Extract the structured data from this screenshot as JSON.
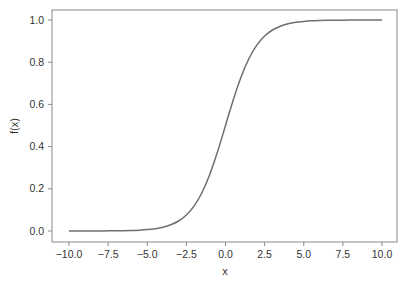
{
  "chart_data": {
    "type": "line",
    "title": "",
    "xlabel": "x",
    "ylabel": "f(x)",
    "xlim": [
      -10.8,
      11.0
    ],
    "ylim": [
      -0.05,
      1.05
    ],
    "grid": false,
    "legend": null,
    "x_ticks": [
      -10.0,
      -7.5,
      -5.0,
      -2.5,
      0.0,
      2.5,
      5.0,
      7.5,
      10.0
    ],
    "x_tick_labels": [
      "−10.0",
      "−7.5",
      "−5.0",
      "−2.5",
      "0.0",
      "2.5",
      "5.0",
      "7.5",
      "10.0"
    ],
    "y_ticks": [
      0.0,
      0.2,
      0.4,
      0.6,
      0.8,
      1.0
    ],
    "y_tick_labels": [
      "0.0",
      "0.2",
      "0.4",
      "0.6",
      "0.8",
      "1.0"
    ],
    "series": [
      {
        "name": "f(x)",
        "color": "#6f6f6f",
        "x": [
          -10,
          -9.5,
          -9,
          -8.5,
          -8,
          -7.5,
          -7,
          -6.5,
          -6,
          -5.5,
          -5,
          -4.5,
          -4,
          -3.5,
          -3,
          -2.5,
          -2,
          -1.5,
          -1,
          -0.5,
          0,
          0.5,
          1,
          1.5,
          2,
          2.5,
          3,
          3.5,
          4,
          4.5,
          5,
          5.5,
          6,
          6.5,
          7,
          7.5,
          8,
          8.5,
          9,
          9.5,
          10
        ],
        "y": [
          0.0,
          0.0001,
          0.0001,
          0.0002,
          0.0003,
          0.0006,
          0.0009,
          0.0015,
          0.0025,
          0.0041,
          0.0067,
          0.011,
          0.018,
          0.0293,
          0.0474,
          0.0759,
          0.1192,
          0.1824,
          0.2689,
          0.3775,
          0.5,
          0.6225,
          0.7311,
          0.8176,
          0.8808,
          0.9241,
          0.9526,
          0.9707,
          0.982,
          0.989,
          0.9933,
          0.9959,
          0.9975,
          0.9985,
          0.9991,
          0.9994,
          0.9997,
          0.9998,
          0.9999,
          0.9999,
          1.0
        ]
      }
    ]
  },
  "style": {
    "axis_color": "#8a8a8a",
    "text_color": "#333333",
    "background": "#ffffff"
  }
}
